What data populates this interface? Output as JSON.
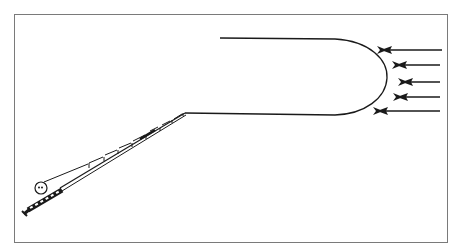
{
  "figure": {
    "elements": {
      "rod": {
        "label": "fishing rod",
        "butt": [
          24,
          213
        ],
        "tip": [
          185,
          113
        ]
      },
      "reel": {
        "label": "reel",
        "center": [
          40,
          188
        ]
      },
      "line_loop": {
        "label": "fly line loop",
        "top_start": [
          220,
          38
        ],
        "bottom_start": [
          185,
          113
        ],
        "apex": [
          387,
          78
        ]
      },
      "wind_arrows": {
        "label": "wind direction arrows",
        "count": 5,
        "direction": "right-to-left",
        "arrows": [
          {
            "from": [
              442,
              50
            ],
            "to": [
              382,
              50
            ]
          },
          {
            "from": [
              440,
              65
            ],
            "to": [
              397,
              65
            ]
          },
          {
            "from": [
              440,
              82
            ],
            "to": [
              403,
              82
            ]
          },
          {
            "from": [
              440,
              97
            ],
            "to": [
              398,
              97
            ]
          },
          {
            "from": [
              440,
              111
            ],
            "to": [
              378,
              111
            ]
          }
        ]
      }
    },
    "colors": {
      "stroke": "#1a1a1a",
      "frame": "#7a7a7a",
      "background": "#ffffff"
    }
  }
}
